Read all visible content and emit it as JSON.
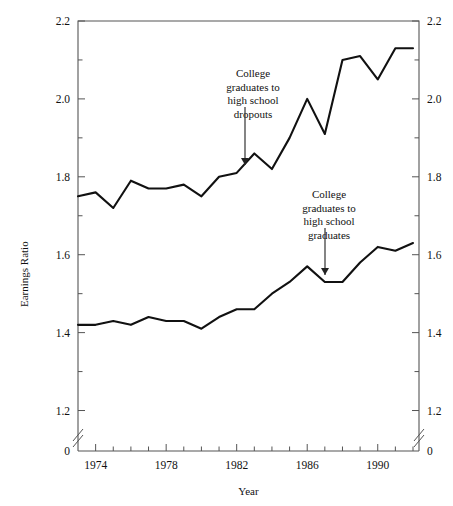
{
  "figure": {
    "faint_header": "",
    "ylabel": "Earnings Ratio",
    "xlabel": "Year"
  },
  "axes": {
    "y_ticks": [
      "2.2",
      "2.0",
      "1.8",
      "1.6",
      "1.4",
      "1.2"
    ],
    "y_zero_label": "0",
    "x_ticks": [
      "1974",
      "1978",
      "1982",
      "1986",
      "1990"
    ],
    "break_marker": "//"
  },
  "annotations": [
    {
      "id": "upper-series-label",
      "lines": [
        "College",
        "graduates to",
        "high school",
        "dropouts"
      ],
      "arrow": "down-arrow"
    },
    {
      "id": "lower-series-label",
      "lines": [
        "College",
        "graduates to",
        "high school",
        "graduates"
      ],
      "arrow": "down-arrow"
    }
  ],
  "chart_data": {
    "type": "line",
    "title": "",
    "xlabel": "Year",
    "ylabel": "Earnings Ratio",
    "xlim": [
      1973,
      1992
    ],
    "ylim": [
      1.15,
      2.2
    ],
    "y_axis_break": true,
    "y_break_from": 0,
    "grid": false,
    "legend": "annotated-inline",
    "x": [
      1973,
      1974,
      1975,
      1976,
      1977,
      1978,
      1979,
      1980,
      1981,
      1982,
      1983,
      1984,
      1985,
      1986,
      1987,
      1988,
      1989,
      1990,
      1991,
      1992
    ],
    "series": [
      {
        "name": "College graduates to high school dropouts",
        "values": [
          1.75,
          1.76,
          1.72,
          1.79,
          1.77,
          1.77,
          1.78,
          1.75,
          1.8,
          1.81,
          1.86,
          1.82,
          1.9,
          2.0,
          1.91,
          2.1,
          2.11,
          2.05,
          2.13,
          2.13
        ]
      },
      {
        "name": "College graduates to high school graduates",
        "values": [
          1.42,
          1.42,
          1.43,
          1.42,
          1.44,
          1.43,
          1.43,
          1.41,
          1.44,
          1.46,
          1.46,
          1.5,
          1.53,
          1.57,
          1.53,
          1.53,
          1.58,
          1.62,
          1.61,
          1.63
        ]
      }
    ]
  }
}
